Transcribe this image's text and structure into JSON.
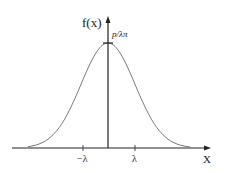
{
  "chart_data": {
    "type": "line",
    "title": "",
    "xlabel": "X",
    "ylabel": "f(x)",
    "peak_label": "p/λπ",
    "x_ticks": [
      {
        "label": "−λ",
        "value": -1
      },
      {
        "label": "λ",
        "value": 1
      }
    ],
    "series": [
      {
        "name": "f(x)",
        "description": "Bell-shaped (Lorentzian/Gaussian-like) curve centered at x=0 with peak value p/λπ",
        "x": [
          -3,
          -2.5,
          -2,
          -1.5,
          -1,
          -0.5,
          0,
          0.5,
          1,
          1.5,
          2,
          2.5,
          3
        ],
        "values": [
          0.02,
          0.06,
          0.15,
          0.33,
          0.58,
          0.86,
          1.0,
          0.86,
          0.58,
          0.33,
          0.15,
          0.06,
          0.02
        ]
      }
    ],
    "grid": false,
    "legend": null
  },
  "labels": {
    "y_axis": "f(x)",
    "x_axis": "X",
    "peak": "p/λπ",
    "tick_neg": "−λ",
    "tick_pos": "λ"
  },
  "colors": {
    "axis": "#222222",
    "curve": "#555555"
  }
}
